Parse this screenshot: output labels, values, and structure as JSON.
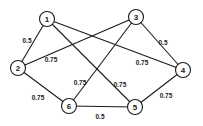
{
  "diagram": {
    "type": "weighted-undirected-graph",
    "nodes": [
      {
        "id": "1",
        "label": "1",
        "x": 47,
        "y": 19
      },
      {
        "id": "2",
        "label": "2",
        "x": 18,
        "y": 68
      },
      {
        "id": "3",
        "label": "3",
        "x": 136,
        "y": 17
      },
      {
        "id": "4",
        "label": "4",
        "x": 183,
        "y": 70
      },
      {
        "id": "5",
        "label": "5",
        "x": 135,
        "y": 107
      },
      {
        "id": "6",
        "label": "6",
        "x": 69,
        "y": 106
      }
    ],
    "edges": [
      {
        "from": "1",
        "to": "2",
        "weight": "0.5",
        "label_x": 27,
        "label_y": 40
      },
      {
        "from": "3",
        "to": "2",
        "weight": "0.75",
        "label_x": 51,
        "label_y": 59
      },
      {
        "from": "1",
        "to": "4",
        "weight": "0.75",
        "label_x": 142,
        "label_y": 62
      },
      {
        "from": "1",
        "to": "5",
        "weight": "0.75",
        "label_x": 120,
        "label_y": 84
      },
      {
        "from": "3",
        "to": "6",
        "weight": "0.75",
        "label_x": 80,
        "label_y": 82
      },
      {
        "from": "3",
        "to": "4",
        "weight": "0.5",
        "label_x": 163,
        "label_y": 42
      },
      {
        "from": "2",
        "to": "6",
        "weight": "0.75",
        "label_x": 38,
        "label_y": 97
      },
      {
        "from": "6",
        "to": "5",
        "weight": "0.5",
        "label_x": 100,
        "label_y": 116
      },
      {
        "from": "5",
        "to": "4",
        "weight": "0.75",
        "label_x": 166,
        "label_y": 95
      }
    ],
    "node_radius": 7.5,
    "colors": {
      "stroke": "#1a1a1a",
      "background": "#ffffff"
    }
  }
}
